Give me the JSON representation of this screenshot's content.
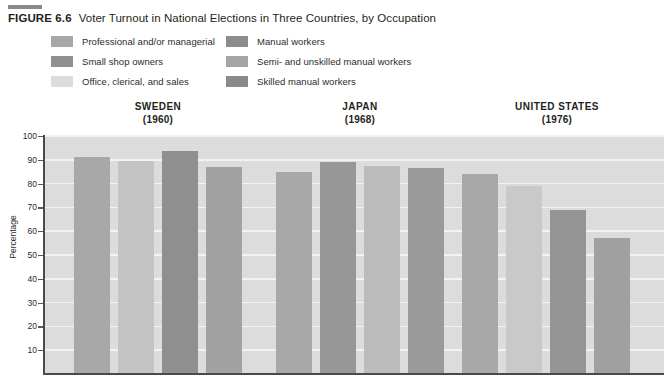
{
  "figure": {
    "label": "FIGURE 6.6",
    "title": "Voter Turnout in National Elections in Three Countries, by Occupation"
  },
  "legend": {
    "items": [
      {
        "label": "Professional and/or managerial",
        "color": "#a8a8a8"
      },
      {
        "label": "Manual workers",
        "color": "#8c8c8c"
      },
      {
        "label": "Small shop owners",
        "color": "#8f8f8f"
      },
      {
        "label": "Semi- and unskilled manual workers",
        "color": "#a5a5a5"
      },
      {
        "label": "Office, clerical, and sales",
        "color": "#dcdcdc"
      },
      {
        "label": "Skilled manual workers",
        "color": "#8a8a8a"
      }
    ]
  },
  "chart_data": {
    "type": "bar",
    "title": "Voter Turnout in National Elections in Three Countries, by Occupation",
    "xlabel": "",
    "ylabel": "Percentage",
    "ylim": [
      0,
      100
    ],
    "yticks": [
      10,
      20,
      30,
      40,
      50,
      60,
      70,
      80,
      90,
      100
    ],
    "grid": true,
    "legend_position": "top",
    "categories": [
      "SWEDEN (1960)",
      "JAPAN (1968)",
      "UNITED STATES (1976)"
    ],
    "groups": [
      {
        "country": "SWEDEN",
        "year": "(1960)",
        "bars": [
          {
            "series": "Professional and/or managerial",
            "value": 91,
            "color": "#a8a8a8"
          },
          {
            "series": "Office, clerical, and sales",
            "value": 89.5,
            "color": "#c4c4c4"
          },
          {
            "series": "Small shop owners",
            "value": 93.5,
            "color": "#8f8f8f"
          },
          {
            "series": "Manual workers",
            "value": 87,
            "color": "#a2a2a2"
          }
        ]
      },
      {
        "country": "JAPAN",
        "year": "(1968)",
        "bars": [
          {
            "series": "Professional and/or managerial",
            "value": 85,
            "color": "#a8a8a8"
          },
          {
            "series": "Small shop owners",
            "value": 89,
            "color": "#979797"
          },
          {
            "series": "Semi- and unskilled manual workers",
            "value": 87.5,
            "color": "#bcbcbc"
          },
          {
            "series": "Skilled manual workers",
            "value": 86.5,
            "color": "#9a9a9a"
          }
        ]
      },
      {
        "country": "UNITED STATES",
        "year": "(1976)",
        "bars": [
          {
            "series": "Professional and/or managerial",
            "value": 84,
            "color": "#a8a8a8"
          },
          {
            "series": "Office, clerical, and sales",
            "value": 79,
            "color": "#c9c9c9"
          },
          {
            "series": "Skilled manual workers",
            "value": 69,
            "color": "#959595"
          },
          {
            "series": "Semi- and unskilled manual workers",
            "value": 57,
            "color": "#a0a0a0"
          }
        ]
      }
    ]
  }
}
